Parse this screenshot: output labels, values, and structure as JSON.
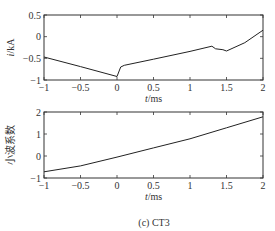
{
  "chart_data": [
    {
      "type": "line",
      "xlabel": "t/ms",
      "ylabel": "i/kA",
      "xlim": [
        -1,
        2
      ],
      "ylim": [
        -1,
        0.5
      ],
      "xticks": [
        "-1",
        "-0.5",
        "0",
        "0.5",
        "1",
        "1.5",
        "2"
      ],
      "yticks": [
        "-1",
        "-0.5",
        "0",
        "0.5"
      ],
      "grid": false,
      "series": [
        {
          "name": "current",
          "x": [
            -1,
            -0.5,
            0,
            0.05,
            0.1,
            0.5,
            1.0,
            1.3,
            1.35,
            1.45,
            1.5,
            1.75,
            2.0
          ],
          "y": [
            -0.47,
            -0.69,
            -0.92,
            -0.7,
            -0.66,
            -0.52,
            -0.34,
            -0.22,
            -0.28,
            -0.3,
            -0.33,
            -0.14,
            0.15
          ]
        }
      ]
    },
    {
      "type": "line",
      "xlabel": "t/ms",
      "ylabel": "小波系数",
      "xlim": [
        -1,
        2
      ],
      "ylim": [
        -1,
        2
      ],
      "xticks": [
        "-1",
        "-0.5",
        "0",
        "0.5",
        "1",
        "1.5",
        "2"
      ],
      "yticks": [
        "-1",
        "0",
        "1",
        "2"
      ],
      "grid": false,
      "series": [
        {
          "name": "wavelet coefficient",
          "x": [
            -1,
            -0.5,
            0,
            0.5,
            1.0,
            1.5,
            2.0
          ],
          "y": [
            -0.72,
            -0.45,
            -0.05,
            0.37,
            0.78,
            1.28,
            1.78
          ]
        }
      ]
    }
  ],
  "caption": "(c) CT3",
  "top": {
    "ylabel": "i/kA",
    "xlabel": "t/ms"
  },
  "bottom": {
    "ylabel": "小波系数",
    "xlabel": "t/ms"
  }
}
